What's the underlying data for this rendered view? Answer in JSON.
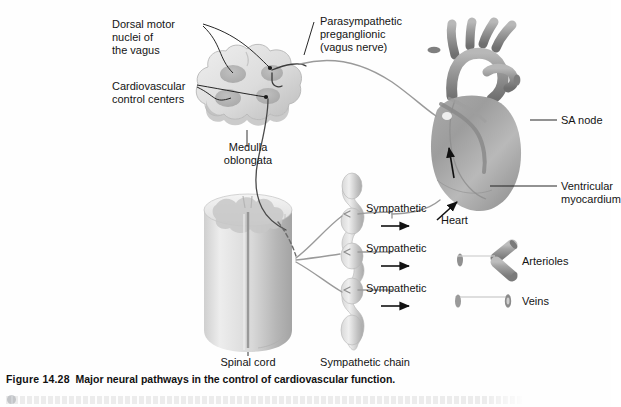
{
  "figure": {
    "number": "Figure 14.28",
    "caption": "Major neural pathways in the control of cardiovascular function.",
    "background_color": "#fefefe",
    "ink_color": "#141414"
  },
  "labels": {
    "dorsal_motor": "Dorsal motor\nnuclei of\nthe vagus",
    "cardiovascular_centers": "Cardiovascular\ncontrol centers",
    "parasympathetic": "Parasympathetic\npreganglionic\n(vagus nerve)",
    "medulla": "Medulla\noblongata",
    "sa_node": "SA node",
    "ventricular_myocardium": "Ventricular\nmyocardium",
    "heart": "Heart",
    "spinal_cord": "Spinal cord",
    "sympathetic_chain": "Sympathetic chain",
    "sympathetic_1": "Sympathetic",
    "sympathetic_2": "Sympathetic",
    "sympathetic_3": "Sympathetic",
    "arterioles": "Arterioles",
    "veins": "Veins"
  },
  "structures": {
    "medulla_oblongata": "medulla-oblongata",
    "spinal_cord": "spinal-cord",
    "sympathetic_chain": "sympathetic-chain",
    "heart": "heart",
    "arteriole_vessel": "arteriole-vessel",
    "vein_vessel": "vein-vessel"
  },
  "colors": {
    "tissue_light": "#e3e3e3",
    "tissue_mid": "#c9c9c9",
    "tissue_dark": "#a8a8a8",
    "nucleus": "#b5b5b5",
    "nerve_dark": "#3a3a3a",
    "nerve_grey": "#9a9a9a",
    "arrow": "#111111"
  }
}
